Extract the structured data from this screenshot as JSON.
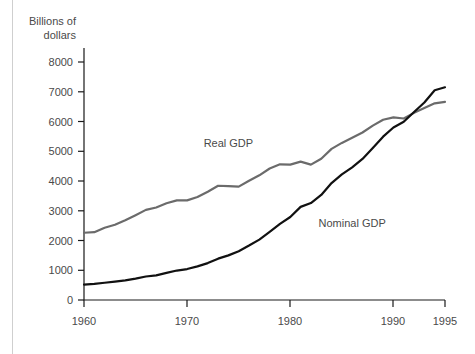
{
  "chart_data": {
    "type": "line",
    "title": "",
    "subtitle": "",
    "ylabel_line1": "Billions of",
    "ylabel_line2": "dollars",
    "xlabel": "",
    "xlim": [
      1960,
      1995
    ],
    "ylim": [
      0,
      8000
    ],
    "grid": false,
    "legend_position": "inline-annotations",
    "yticks": [
      0,
      1000,
      2000,
      3000,
      4000,
      5000,
      6000,
      7000,
      8000
    ],
    "ytick_labels": [
      "0",
      "1000",
      "2000",
      "3000",
      "4000",
      "5000",
      "6000",
      "7000",
      "8000"
    ],
    "xticks": [
      1960,
      1970,
      1980,
      1990,
      1995
    ],
    "xtick_labels": [
      "1960",
      "1970",
      "1980",
      "1990",
      "1995"
    ],
    "x": [
      1960,
      1961,
      1962,
      1963,
      1964,
      1965,
      1966,
      1967,
      1968,
      1969,
      1970,
      1971,
      1972,
      1973,
      1974,
      1975,
      1976,
      1977,
      1978,
      1979,
      1980,
      1981,
      1982,
      1983,
      1984,
      1985,
      1986,
      1987,
      1988,
      1989,
      1990,
      1991,
      1992,
      1993,
      1994,
      1995
    ],
    "series": [
      {
        "name": "Real GDP",
        "color": "#6b6b6b",
        "label_x": 1974,
        "label_y": 5150,
        "values": [
          2260,
          2280,
          2430,
          2530,
          2680,
          2850,
          3030,
          3110,
          3250,
          3350,
          3350,
          3460,
          3640,
          3840,
          3830,
          3810,
          4010,
          4190,
          4420,
          4560,
          4550,
          4650,
          4550,
          4750,
          5080,
          5280,
          5450,
          5630,
          5860,
          6060,
          6140,
          6100,
          6290,
          6450,
          6610,
          6660
        ]
      },
      {
        "name": "Nominal GDP",
        "color": "#111111",
        "label_x": 1986,
        "label_y": 2450,
        "values": [
          520,
          540,
          580,
          620,
          660,
          720,
          790,
          830,
          910,
          990,
          1040,
          1130,
          1240,
          1390,
          1500,
          1640,
          1830,
          2030,
          2290,
          2560,
          2790,
          3130,
          3260,
          3530,
          3930,
          4220,
          4460,
          4740,
          5110,
          5490,
          5800,
          5990,
          6320,
          6640,
          7050,
          7150
        ]
      }
    ]
  }
}
